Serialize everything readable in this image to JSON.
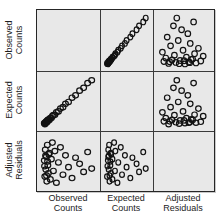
{
  "figure": {
    "background": "#ffffff",
    "panel_background": "#e8e8e8",
    "grid_line_color": "#3a3a3a",
    "frame_color": "#262626",
    "label_color": "#1c1c1c",
    "marker": {
      "shape": "open-circle",
      "stroke": "#121212",
      "stroke_width": 1.2,
      "radius": 4.6,
      "fill": "none"
    }
  },
  "chart_data": {
    "type": "scatter",
    "subtype": "scatterplot-matrix",
    "title": "",
    "diagonal": "empty",
    "grid": "off",
    "axis_tick_labels": "none",
    "variables": [
      {
        "key": "observed",
        "label": "Observed Counts"
      },
      {
        "key": "expected",
        "label": "Expected Counts"
      },
      {
        "key": "residuals",
        "label": "Adjusted Residuals"
      }
    ],
    "panel_layout": "cell(row i, col j) plots x = variables[j], y = variables[i]; diagonal cells empty",
    "relationships": {
      "observed_vs_expected": "near-perfect positive linear, points dense at low values",
      "residuals_vs_counts": "uncorrelated scattered cloud"
    },
    "points": {
      "observed": [
        0.02,
        0.025,
        0.03,
        0.04,
        0.045,
        0.05,
        0.06,
        0.065,
        0.07,
        0.08,
        0.085,
        0.09,
        0.1,
        0.11,
        0.12,
        0.14,
        0.16,
        0.18,
        0.2,
        0.23,
        0.26,
        0.3,
        0.34,
        0.39,
        0.44,
        0.5,
        0.57,
        0.64,
        0.72,
        0.8,
        0.88,
        0.96
      ],
      "expected": [
        0.04,
        0.03,
        0.02,
        0.05,
        0.06,
        0.06,
        0.05,
        0.08,
        0.08,
        0.07,
        0.1,
        0.1,
        0.11,
        0.12,
        0.11,
        0.15,
        0.15,
        0.19,
        0.21,
        0.22,
        0.27,
        0.29,
        0.35,
        0.38,
        0.45,
        0.49,
        0.58,
        0.63,
        0.73,
        0.79,
        0.89,
        0.95
      ],
      "residuals": [
        0.52,
        0.4,
        0.18,
        0.75,
        0.62,
        0.33,
        0.6,
        0.2,
        0.08,
        0.85,
        0.5,
        0.42,
        0.25,
        0.65,
        0.68,
        0.12,
        0.55,
        0.9,
        0.3,
        0.72,
        0.05,
        0.48,
        0.8,
        0.22,
        0.63,
        0.38,
        0.15,
        0.58,
        0.45,
        0.28,
        0.7,
        0.35
      ],
      "scale_note": "normalized 0-1; no numeric tick labels are shown in the figure"
    }
  }
}
